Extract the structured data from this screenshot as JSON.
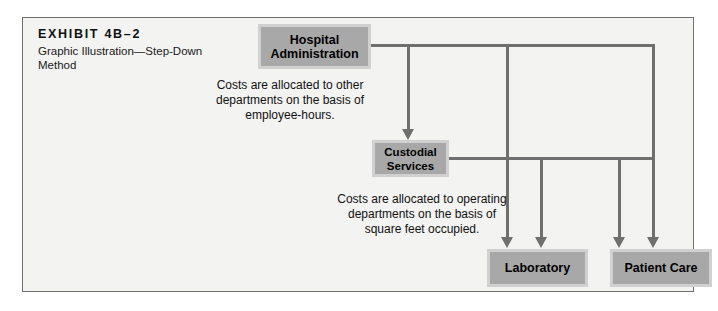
{
  "exhibit": {
    "title": "EXHIBIT 4B–2",
    "subtitle_line1": "Graphic Illustration—Step-Down",
    "subtitle_line2": "Method"
  },
  "nodes": {
    "hospital_administration": "Hospital Administration",
    "custodial_services": "Custodial Services",
    "laboratory": "Laboratory",
    "patient_care": "Patient Care"
  },
  "annotations": {
    "employee_hours": "Costs are allocated to other departments on the basis of employee-hours.",
    "square_feet": "Costs are allocated to operating departments on the basis of square feet occupied."
  },
  "colors": {
    "page_background": "#ffffff",
    "frame_background": "#f3f3f1",
    "frame_border": "#6e6e6e",
    "node_fill": "#a8a8a8",
    "node_border": "#d0d0d0",
    "connector": "#6f6f6f",
    "text": "#111111"
  },
  "flow": {
    "type": "step-down-allocation-diagram",
    "service_departments": [
      "Hospital Administration",
      "Custodial Services"
    ],
    "operating_departments": [
      "Laboratory",
      "Patient Care"
    ],
    "edges": [
      {
        "from": "Hospital Administration",
        "to": "Custodial Services",
        "basis": "employee-hours"
      },
      {
        "from": "Hospital Administration",
        "to": "Laboratory",
        "basis": "employee-hours"
      },
      {
        "from": "Hospital Administration",
        "to": "Patient Care",
        "basis": "employee-hours"
      },
      {
        "from": "Custodial Services",
        "to": "Laboratory",
        "basis": "square feet occupied"
      },
      {
        "from": "Custodial Services",
        "to": "Patient Care",
        "basis": "square feet occupied"
      }
    ]
  }
}
